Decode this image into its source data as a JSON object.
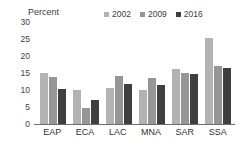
{
  "chart_data": {
    "type": "bar",
    "title": "",
    "subtitle": "",
    "xlabel": "",
    "ylabel": "Percent",
    "ylim": [
      0,
      30
    ],
    "yticks": [
      30,
      25,
      20,
      15,
      10,
      5,
      0
    ],
    "grid": false,
    "legend_position": "top-right",
    "categories": [
      "EAP",
      "ECA",
      "LAC",
      "MNA",
      "SAR",
      "SSA"
    ],
    "series": [
      {
        "name": "2002",
        "color": "#b3b3b3",
        "values": [
          14.9,
          10.1,
          10.6,
          10.0,
          16.2,
          25.2
        ]
      },
      {
        "name": "2009",
        "color": "#969696",
        "values": [
          13.9,
          4.7,
          14.2,
          13.6,
          14.9,
          17.0
        ]
      },
      {
        "name": "2016",
        "color": "#3f3f3f",
        "values": [
          10.2,
          7.0,
          11.9,
          11.5,
          14.8,
          16.5
        ]
      }
    ]
  },
  "axis": {
    "y_title": "Percent"
  },
  "colors": {
    "background": "#ffffff",
    "axis_line": "#6f6f6f",
    "text": "#404040"
  }
}
